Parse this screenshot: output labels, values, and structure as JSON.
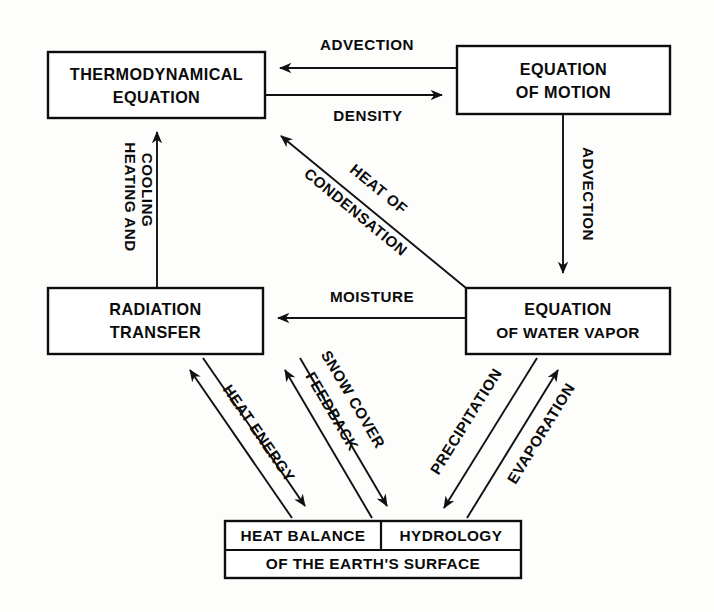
{
  "diagram": {
    "type": "flow-diagram",
    "background_color": "#fdfdfc",
    "line_color": "#111111",
    "boxes": [
      {
        "id": "thermodynamical-equation",
        "lines": [
          "THERMODYNAMICAL",
          "EQUATION"
        ]
      },
      {
        "id": "equation-of-motion",
        "lines": [
          "EQUATION",
          "OF MOTION"
        ]
      },
      {
        "id": "radiation-transfer",
        "lines": [
          "RADIATION",
          "TRANSFER"
        ]
      },
      {
        "id": "equation-of-water-vapor",
        "lines": [
          "EQUATION",
          "OF WATER VAPOR"
        ]
      },
      {
        "id": "earth-surface",
        "lines": [
          "HEAT BALANCE",
          "HYDROLOGY",
          "OF THE EARTH'S SURFACE"
        ]
      }
    ],
    "box_text": {
      "thermo_line1": "THERMODYNAMICAL",
      "thermo_line2": "EQUATION",
      "motion_line1": "EQUATION",
      "motion_line2": "OF MOTION",
      "radiation_line1": "RADIATION",
      "radiation_line2": "TRANSFER",
      "vapor_line1": "EQUATION",
      "vapor_line2": "OF WATER VAPOR",
      "surface_heat_balance": "HEAT BALANCE",
      "surface_hydrology": "HYDROLOGY",
      "surface_bottom": "OF THE EARTH'S SURFACE"
    },
    "edges": [
      {
        "id": "advection-top",
        "label": "ADVECTION",
        "from": "equation-of-motion",
        "to": "thermodynamical-equation",
        "direction": "left"
      },
      {
        "id": "density",
        "label": "DENSITY",
        "from": "thermodynamical-equation",
        "to": "equation-of-motion",
        "direction": "right"
      },
      {
        "id": "heating-and-cooling",
        "label_line1": "HEATING AND",
        "label_line2": "COOLING",
        "label": "HEATING AND COOLING",
        "from": "radiation-transfer",
        "to": "thermodynamical-equation",
        "direction": "up"
      },
      {
        "id": "advection-right",
        "label": "ADVECTION",
        "from": "equation-of-motion",
        "to": "equation-of-water-vapor",
        "direction": "down"
      },
      {
        "id": "heat-of-condensation",
        "label_line1": "HEAT OF",
        "label_line2": "CONDENSATION",
        "label": "HEAT OF CONDENSATION",
        "from": "equation-of-water-vapor",
        "to": "thermodynamical-equation",
        "direction": "up-left"
      },
      {
        "id": "moisture",
        "label": "MOISTURE",
        "from": "equation-of-water-vapor",
        "to": "radiation-transfer",
        "direction": "left"
      },
      {
        "id": "heat-energy",
        "label": "HEAT ENERGY",
        "from": "earth-surface",
        "to": "radiation-transfer",
        "direction": "bidirectional"
      },
      {
        "id": "snow-cover-feedback",
        "label_line1": "SNOW COVER",
        "label_line2": "FEEDBACK",
        "label": "SNOW COVER FEEDBACK",
        "from": "earth-surface",
        "to": "radiation-transfer",
        "direction": "bidirectional"
      },
      {
        "id": "precipitation",
        "label": "PRECIPITATION",
        "from": "equation-of-water-vapor",
        "to": "earth-surface",
        "direction": "down-left"
      },
      {
        "id": "evaporation",
        "label": "EVAPORATION",
        "from": "earth-surface",
        "to": "equation-of-water-vapor",
        "direction": "up-right"
      }
    ],
    "edge_text": {
      "advection_top": "ADVECTION",
      "density": "DENSITY",
      "heating_1": "HEATING AND",
      "heating_2": "COOLING",
      "advection_right": "ADVECTION",
      "condensation_1": "HEAT OF",
      "condensation_2": "CONDENSATION",
      "moisture": "MOISTURE",
      "heat_energy": "HEAT ENERGY",
      "snow_1": "SNOW COVER",
      "snow_2": "FEEDBACK",
      "precipitation": "PRECIPITATION",
      "evaporation": "EVAPORATION"
    }
  }
}
